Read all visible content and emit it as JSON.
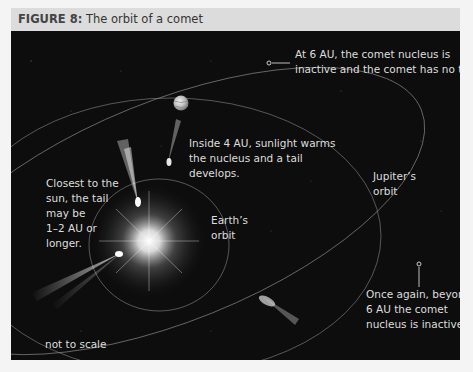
{
  "figure": {
    "number_label": "FIGURE 8:",
    "title": " The orbit of a comet"
  },
  "labels": {
    "six_au_inactive_line1": "At 6 AU, the comet nucleus is",
    "six_au_inactive_line2": "inactive and the comet has no tail.",
    "inside_4au_line1": "Inside 4 AU, sunlight warms",
    "inside_4au_line2": "the nucleus and a tail",
    "inside_4au_line3": "develops.",
    "closest_line1": "Closest to the",
    "closest_line2": "sun, the tail",
    "closest_line3": "may be",
    "closest_line4": "1–2 AU or",
    "closest_line5": "longer.",
    "earth_orbit_line1": "Earth’s",
    "earth_orbit_line2": "orbit",
    "jupiter_orbit_line1": "Jupiter’s",
    "jupiter_orbit_line2": "orbit",
    "once_again_line1": "Once again, beyond",
    "once_again_line2": "6 AU the comet",
    "once_again_line3": "nucleus is inactive.",
    "not_to_scale": "not to scale"
  },
  "colors": {
    "panel_background": "#0d0d0d",
    "header_background": "#dcdcdc",
    "text": "#dedede",
    "orbit_line": "#8a8a8a"
  }
}
